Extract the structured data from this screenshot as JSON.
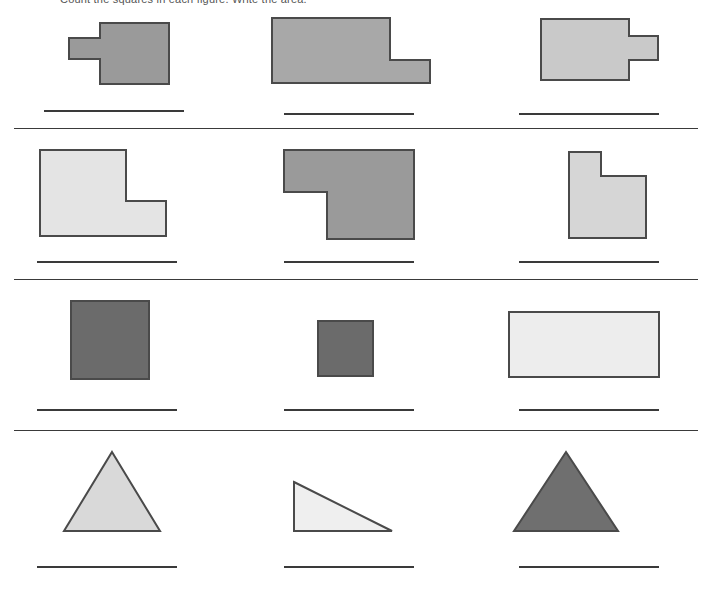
{
  "page": {
    "title_clipped": "Count the squares in each figure. Write the area.",
    "background": "#ffffff",
    "width": 712,
    "height": 589
  },
  "palette": {
    "medium_gray": "#9a9a9a",
    "medium_light_gray": "#a8a8a8",
    "light_gray": "#c9c9c9",
    "very_light_gray": "#e4e4e4",
    "pale_gray": "#ededed",
    "dark_gray": "#6b6b6b",
    "outline": "#4a4a4a",
    "rule": "#3a3a3a"
  },
  "rules": [
    {
      "name": "divider-after-row-1",
      "y": 128
    },
    {
      "name": "divider-after-row-2",
      "y": 279
    },
    {
      "name": "divider-after-row-3",
      "y": 430
    }
  ],
  "rows": [
    {
      "name": "row-1",
      "cells": [
        {
          "name": "figure-rect-with-left-tab",
          "shape": "rectangle-with-left-tab",
          "fill": "#9a9a9a",
          "x": 32,
          "y": 12,
          "w": 140,
          "h": 72,
          "points": "37,26 68,26 68,11 137,11 137,72 68,72 68,47 37,47",
          "answer_line": {
            "x": 44,
            "y": 110,
            "w": 140
          }
        },
        {
          "name": "figure-L-lower-right-extension",
          "shape": "L-shape-lower-right",
          "fill": "#a8a8a8",
          "x": 262,
          "y": 12,
          "w": 180,
          "h": 72,
          "points": "10,6 128,6 128,48 168,48 168,71 10,71",
          "answer_line": {
            "x": 284,
            "y": 113,
            "w": 130
          }
        },
        {
          "name": "figure-rect-with-right-tab",
          "shape": "rectangle-with-right-tab",
          "fill": "#c9c9c9",
          "x": 540,
          "y": 12,
          "w": 160,
          "h": 72,
          "points": "0,7 89,7 89,24 118,24 118,48 89,48 89,68 0,68",
          "answer_line": {
            "x": 519,
            "y": 113,
            "w": 140
          }
        }
      ]
    },
    {
      "name": "row-2",
      "cells": [
        {
          "name": "figure-L-shape-notched-upper-right",
          "shape": "L-shape",
          "fill": "#e4e4e4",
          "x": 38,
          "y": 148,
          "w": 130,
          "h": 90,
          "points": "2,2 88,2 88,53 128,53 128,88 2,88",
          "answer_line": {
            "x": 37,
            "y": 261,
            "w": 140
          }
        },
        {
          "name": "figure-L-shape-notched-lower-left",
          "shape": "L-shape-rotated",
          "fill": "#9a9a9a",
          "x": 283,
          "y": 148,
          "w": 135,
          "h": 92,
          "points": "0,2 130,2 130,90 43,90 43,43 0,43",
          "answer_line": {
            "x": 284,
            "y": 261,
            "w": 130
          }
        },
        {
          "name": "figure-square-notched-upper-right",
          "shape": "square-notched",
          "fill": "#d6d6d6",
          "x": 567,
          "y": 150,
          "w": 80,
          "h": 90,
          "points": "2,2 34,2 34,26 79,26 79,88 2,88",
          "answer_line": {
            "x": 519,
            "y": 261,
            "w": 140
          }
        }
      ]
    },
    {
      "name": "row-3",
      "cells": [
        {
          "name": "figure-large-dark-square",
          "shape": "square",
          "fill": "#6b6b6b",
          "x": 70,
          "y": 300,
          "w": 80,
          "h": 80,
          "points": "1,1 79,1 79,79 1,79",
          "answer_line": {
            "x": 37,
            "y": 409,
            "w": 140
          }
        },
        {
          "name": "figure-small-dark-square",
          "shape": "square",
          "fill": "#6b6b6b",
          "x": 317,
          "y": 320,
          "w": 57,
          "h": 57,
          "points": "1,1 56,1 56,56 1,56",
          "answer_line": {
            "x": 284,
            "y": 409,
            "w": 130
          }
        },
        {
          "name": "figure-light-wide-rectangle",
          "shape": "rectangle",
          "fill": "#ededed",
          "x": 508,
          "y": 311,
          "w": 152,
          "h": 67,
          "points": "1,1 151,1 151,66 1,66",
          "answer_line": {
            "x": 519,
            "y": 409,
            "w": 140
          }
        }
      ]
    },
    {
      "name": "row-4",
      "cells": [
        {
          "name": "figure-light-triangle",
          "shape": "triangle-isosceles",
          "fill": "#d9d9d9",
          "x": 62,
          "y": 450,
          "w": 100,
          "h": 83,
          "points": "50,2 98,81 2,81",
          "answer_line": {
            "x": 37,
            "y": 566,
            "w": 140
          }
        },
        {
          "name": "figure-right-triangle",
          "shape": "triangle-right",
          "fill": "#efefef",
          "x": 292,
          "y": 480,
          "w": 102,
          "h": 53,
          "points": "2,2 100,51 2,51",
          "answer_line": {
            "x": 284,
            "y": 566,
            "w": 130
          }
        },
        {
          "name": "figure-dark-triangle",
          "shape": "triangle-isosceles",
          "fill": "#6f6f6f",
          "x": 512,
          "y": 450,
          "w": 110,
          "h": 83,
          "points": "54,2 106,81 2,81",
          "answer_line": {
            "x": 519,
            "y": 566,
            "w": 140
          }
        }
      ]
    }
  ]
}
